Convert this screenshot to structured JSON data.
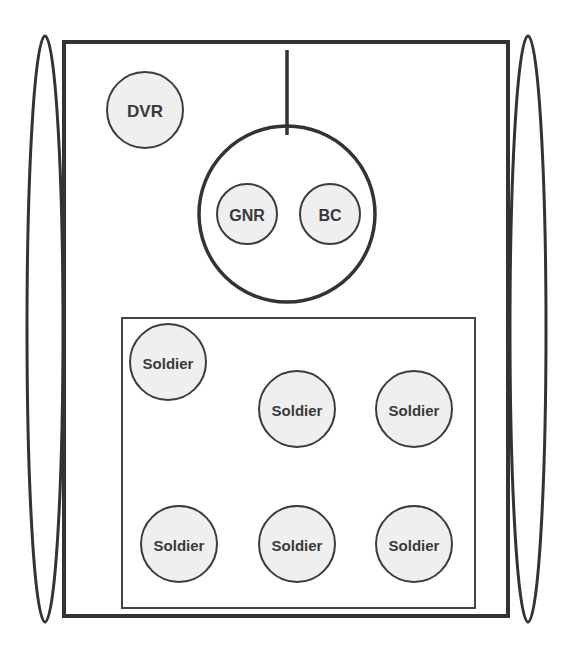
{
  "diagram": {
    "colors": {
      "stroke": "#333333",
      "seat_fill": "#efefef",
      "background": "#ffffff",
      "text": "#3a3a3a"
    },
    "hull": {
      "x": 64,
      "y": 42,
      "w": 444,
      "h": 574
    },
    "tracks": [
      {
        "name": "left-track",
        "cx": 45,
        "cy": 329,
        "rx": 18,
        "ry": 293
      },
      {
        "name": "right-track",
        "cx": 528,
        "cy": 329,
        "rx": 18,
        "ry": 293
      }
    ],
    "turret": {
      "cx": 287,
      "cy": 214,
      "r": 88,
      "gun": {
        "x": 287,
        "y1": 50,
        "y2": 135
      }
    },
    "driver": {
      "label": "DVR",
      "cx": 145,
      "cy": 110,
      "r": 38
    },
    "turret_crew": [
      {
        "label": "GNR",
        "cx": 247,
        "cy": 214,
        "r": 30
      },
      {
        "label": "BC",
        "cx": 330,
        "cy": 214,
        "r": 30
      }
    ],
    "troop_compartment": {
      "x": 122,
      "y": 318,
      "w": 353,
      "h": 290
    },
    "soldiers": [
      {
        "label": "Soldier",
        "cx": 168,
        "cy": 362,
        "r": 38
      },
      {
        "label": "Soldier",
        "cx": 297,
        "cy": 409,
        "r": 38
      },
      {
        "label": "Soldier",
        "cx": 414,
        "cy": 409,
        "r": 38
      },
      {
        "label": "Soldier",
        "cx": 179,
        "cy": 544,
        "r": 38
      },
      {
        "label": "Soldier",
        "cx": 297,
        "cy": 544,
        "r": 38
      },
      {
        "label": "Soldier",
        "cx": 414,
        "cy": 544,
        "r": 38
      }
    ]
  }
}
